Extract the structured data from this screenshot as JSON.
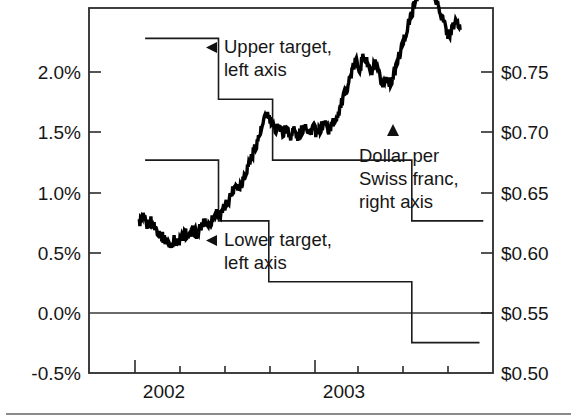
{
  "chart_data": {
    "type": "line",
    "title": "",
    "subtitle": "",
    "xlabel": "",
    "ylabel_left": "",
    "ylabel_right": "",
    "grid": false,
    "legend_position": "inline-annotations",
    "x_axis": {
      "ticks": [
        2002.0,
        2002.25,
        2002.5,
        2002.75,
        2003.0,
        2003.25,
        2003.5,
        2003.75
      ],
      "tick_labels": [
        "2002",
        "",
        "",
        "",
        "2003",
        "",
        "",
        ""
      ],
      "visible_labels": [
        "2002",
        "2003"
      ],
      "xlim": [
        2001.83,
        2003.92
      ]
    },
    "y_axis_left": {
      "tick_labels": [
        "2.0%",
        "1.5%",
        "1.0%",
        "0.5%",
        "0.0%",
        "-0.5%"
      ],
      "tick_values": [
        2.0,
        1.5,
        1.0,
        0.5,
        0.0,
        -0.5
      ],
      "ylim": [
        -0.5,
        2.5
      ],
      "unit": "percent"
    },
    "y_axis_right": {
      "tick_labels": [
        "$0.75",
        "$0.70",
        "$0.65",
        "$0.60",
        "$0.55",
        "$0.50"
      ],
      "tick_values": [
        0.75,
        0.7,
        0.65,
        0.6,
        0.55,
        0.5
      ],
      "ylim": [
        0.5,
        0.75
      ],
      "unit": "US dollars"
    },
    "series": [
      {
        "name": "Upper target, left axis",
        "type": "step",
        "axis": "left",
        "steps": [
          {
            "x_start": 2002.12,
            "x_end": 2002.5,
            "value": 2.25
          },
          {
            "x_start": 2002.5,
            "x_end": 2002.78,
            "value": 1.75
          },
          {
            "x_start": 2002.78,
            "x_end": 2003.5,
            "value": 1.25
          },
          {
            "x_start": 2003.5,
            "x_end": 2003.87,
            "value": 0.75
          }
        ]
      },
      {
        "name": "Lower target, left axis",
        "type": "step",
        "axis": "left",
        "steps": [
          {
            "x_start": 2002.12,
            "x_end": 2002.5,
            "value": 1.25
          },
          {
            "x_start": 2002.5,
            "x_end": 2002.76,
            "value": 0.75
          },
          {
            "x_start": 2002.76,
            "x_end": 2003.5,
            "value": 0.25
          },
          {
            "x_start": 2003.5,
            "x_end": 2003.85,
            "value": -0.25
          }
        ]
      },
      {
        "name": "Dollar per Swiss franc, right axis",
        "type": "line",
        "axis": "right",
        "x": [
          2002.09,
          2002.11,
          2002.13,
          2002.15,
          2002.17,
          2002.19,
          2002.21,
          2002.23,
          2002.25,
          2002.27,
          2002.29,
          2002.31,
          2002.33,
          2002.35,
          2002.37,
          2002.39,
          2002.41,
          2002.43,
          2002.45,
          2002.47,
          2002.49,
          2002.51,
          2002.53,
          2002.55,
          2002.57,
          2002.59,
          2002.61,
          2002.63,
          2002.65,
          2002.67,
          2002.69,
          2002.71,
          2002.73,
          2002.75,
          2002.77,
          2002.79,
          2002.81,
          2002.83,
          2002.85,
          2002.87,
          2002.89,
          2002.91,
          2002.93,
          2002.95,
          2002.97,
          2002.99,
          2003.01,
          2003.03,
          2003.05,
          2003.07,
          2003.09,
          2003.11,
          2003.13,
          2003.15,
          2003.17,
          2003.19,
          2003.21,
          2003.23,
          2003.25,
          2003.27,
          2003.29,
          2003.31,
          2003.33,
          2003.35,
          2003.37,
          2003.39,
          2003.41,
          2003.43,
          2003.45,
          2003.47,
          2003.49,
          2003.51,
          2003.53,
          2003.55,
          2003.57,
          2003.59,
          2003.61,
          2003.63,
          2003.65,
          2003.67,
          2003.69,
          2003.71,
          2003.73,
          2003.75
        ],
        "y": [
          0.603,
          0.606,
          0.601,
          0.604,
          0.6,
          0.597,
          0.593,
          0.59,
          0.588,
          0.591,
          0.589,
          0.592,
          0.596,
          0.593,
          0.598,
          0.595,
          0.6,
          0.604,
          0.601,
          0.606,
          0.61,
          0.607,
          0.613,
          0.618,
          0.624,
          0.63,
          0.627,
          0.634,
          0.641,
          0.648,
          0.655,
          0.662,
          0.67,
          0.678,
          0.672,
          0.666,
          0.67,
          0.664,
          0.668,
          0.662,
          0.667,
          0.661,
          0.666,
          0.671,
          0.664,
          0.669,
          0.663,
          0.668,
          0.672,
          0.666,
          0.671,
          0.675,
          0.682,
          0.69,
          0.698,
          0.706,
          0.714,
          0.709,
          0.717,
          0.712,
          0.705,
          0.711,
          0.704,
          0.697,
          0.703,
          0.698,
          0.706,
          0.715,
          0.724,
          0.733,
          0.742,
          0.751,
          0.76,
          0.768,
          0.775,
          0.77,
          0.762,
          0.754,
          0.746,
          0.738,
          0.731,
          0.736,
          0.742,
          0.735
        ]
      }
    ],
    "annotations": [
      {
        "id": "upper-target",
        "text_lines": [
          "Upper target,",
          "left axis"
        ],
        "marker": "left-triangle"
      },
      {
        "id": "lower-target",
        "text_lines": [
          "Lower target,",
          "left axis"
        ],
        "marker": "left-triangle"
      },
      {
        "id": "dollar-per-swiss-franc",
        "text_lines": [
          "Dollar per",
          "Swiss franc,",
          "right axis"
        ],
        "marker": "up-triangle"
      }
    ]
  },
  "axis": {
    "left_ticks": [
      "2.0%",
      "1.5%",
      "1.0%",
      "0.5%",
      "0.0%",
      "-0.5%"
    ],
    "right_ticks": [
      "$0.75",
      "$0.70",
      "$0.65",
      "$0.60",
      "$0.55",
      "$0.50"
    ],
    "x_ticks": [
      "2002",
      "2003"
    ]
  },
  "callouts": {
    "upper_line1": "Upper target,",
    "upper_line2": "left axis",
    "lower_line1": "Lower target,",
    "lower_line2": "left axis",
    "dollar_line1": "Dollar per",
    "dollar_line2": "Swiss franc,",
    "dollar_line3": "right axis"
  },
  "colors": {
    "ink": "#161616",
    "frame": "#2b2b2b",
    "series": "#000000",
    "footrule": "#8a8a8a",
    "background": "#ffffff"
  }
}
